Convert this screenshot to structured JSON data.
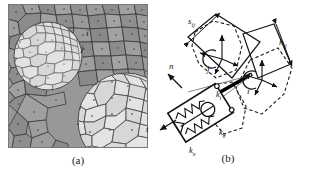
{
  "figure": {
    "width": 312,
    "height": 177,
    "background": "#ffffff"
  },
  "panel_a": {
    "caption": "(a)",
    "description": "grayscale Voronoi tessellation of polygonal grains with two lighter circular inclusions",
    "colors": {
      "matrix_fill": "#8f8f8f",
      "matrix_fill_alt": "#a3a3a3",
      "inclusion_fill": "#d8d8d8",
      "inclusion_fill_alt": "#e6e6e6",
      "grain_edge": "#3a3a3a",
      "nucleus_dot": "#2b2b2b",
      "frame": "#777777"
    },
    "cell_labels": [
      {
        "text": "i",
        "x": 78,
        "y": 30
      },
      {
        "text": "j",
        "x": 72,
        "y": 45
      }
    ],
    "inclusions": [
      {
        "cx": 40,
        "cy": 52,
        "r": 34
      },
      {
        "cx": 118,
        "cy": 117,
        "r": 48
      }
    ]
  },
  "panel_b": {
    "caption": "(b)",
    "description": "discrete element contact model: two rotated rigid blocks, current (solid) and reference (dashed) configurations, joined by a normal/tangential/rotational spring-dashpot contact element",
    "colors": {
      "line": "#1a1a1a",
      "dashed": "#1a1a1a",
      "thin": "#555555",
      "contact_bar": "#000000"
    },
    "labels": {
      "separation": "s",
      "separation_sub": "ij",
      "height": "h",
      "height_sub": "ij",
      "spring_tangential": "k",
      "spring_tangential_sub": "t",
      "spring_rotational": "k",
      "spring_rotational_sub": "θ",
      "spring_normal": "k",
      "spring_normal_sub": "n",
      "axis_normal": "n",
      "axis_tangential": "t",
      "body_i": "i",
      "body_j": "j"
    }
  }
}
